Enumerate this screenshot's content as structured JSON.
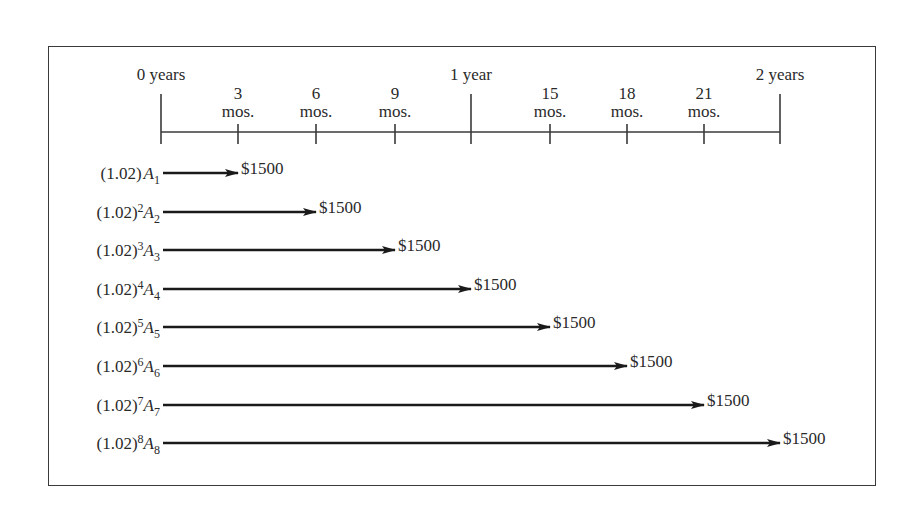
{
  "timeline": {
    "ticks": [
      {
        "pos": 0,
        "x": 161,
        "major": true,
        "label": "0 years",
        "line2": ""
      },
      {
        "pos": 3,
        "x": 238,
        "major": false,
        "label": "3",
        "line2": "mos."
      },
      {
        "pos": 6,
        "x": 316,
        "major": false,
        "label": "6",
        "line2": "mos."
      },
      {
        "pos": 9,
        "x": 395,
        "major": false,
        "label": "9",
        "line2": "mos."
      },
      {
        "pos": 12,
        "x": 471,
        "major": true,
        "label": "1 year",
        "line2": ""
      },
      {
        "pos": 15,
        "x": 550,
        "major": false,
        "label": "15",
        "line2": "mos."
      },
      {
        "pos": 18,
        "x": 627,
        "major": false,
        "label": "18",
        "line2": "mos."
      },
      {
        "pos": 21,
        "x": 704,
        "major": false,
        "label": "21",
        "line2": "mos."
      },
      {
        "pos": 24,
        "x": 780,
        "major": true,
        "label": "2 years",
        "line2": ""
      }
    ]
  },
  "rows": [
    {
      "base": "(1.02)",
      "exp": "",
      "var": "A",
      "sub": "1",
      "amount": "$1500",
      "end_tick": 1
    },
    {
      "base": "(1.02)",
      "exp": "2",
      "var": "A",
      "sub": "2",
      "amount": "$1500",
      "end_tick": 2
    },
    {
      "base": "(1.02)",
      "exp": "3",
      "var": "A",
      "sub": "3",
      "amount": "$1500",
      "end_tick": 3
    },
    {
      "base": "(1.02)",
      "exp": "4",
      "var": "A",
      "sub": "4",
      "amount": "$1500",
      "end_tick": 4
    },
    {
      "base": "(1.02)",
      "exp": "5",
      "var": "A",
      "sub": "5",
      "amount": "$1500",
      "end_tick": 5
    },
    {
      "base": "(1.02)",
      "exp": "6",
      "var": "A",
      "sub": "6",
      "amount": "$1500",
      "end_tick": 6
    },
    {
      "base": "(1.02)",
      "exp": "7",
      "var": "A",
      "sub": "7",
      "amount": "$1500",
      "end_tick": 7
    },
    {
      "base": "(1.02)",
      "exp": "8",
      "var": "A",
      "sub": "8",
      "amount": "$1500",
      "end_tick": 8
    }
  ]
}
